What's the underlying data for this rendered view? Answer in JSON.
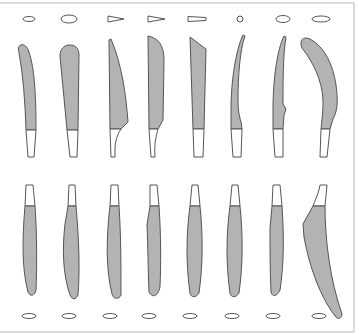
{
  "diagram": {
    "title": "",
    "colors": {
      "blade_fill": "#b3b3b3",
      "stroke": "#555555",
      "frame": "#cfcfcf",
      "background": "#ffffff"
    },
    "top_row": [
      {
        "id": "t1",
        "cross_section": "small-ellipse"
      },
      {
        "id": "t2",
        "cross_section": "ellipse"
      },
      {
        "id": "t3",
        "cross_section": "triangle"
      },
      {
        "id": "t4",
        "cross_section": "triangle"
      },
      {
        "id": "t5",
        "cross_section": "rectangle"
      },
      {
        "id": "t6",
        "cross_section": "circle"
      },
      {
        "id": "t7",
        "cross_section": "ellipse"
      },
      {
        "id": "t8",
        "cross_section": "wide-ellipse"
      }
    ],
    "bottom_row": [
      {
        "id": "b1",
        "cross_section": "ellipse"
      },
      {
        "id": "b2",
        "cross_section": "ellipse"
      },
      {
        "id": "b3",
        "cross_section": "ellipse"
      },
      {
        "id": "b4",
        "cross_section": "ellipse"
      },
      {
        "id": "b5",
        "cross_section": "ellipse"
      },
      {
        "id": "b6",
        "cross_section": "ellipse"
      },
      {
        "id": "b7",
        "cross_section": "ellipse"
      },
      {
        "id": "b8",
        "cross_section": "ellipse"
      }
    ]
  }
}
